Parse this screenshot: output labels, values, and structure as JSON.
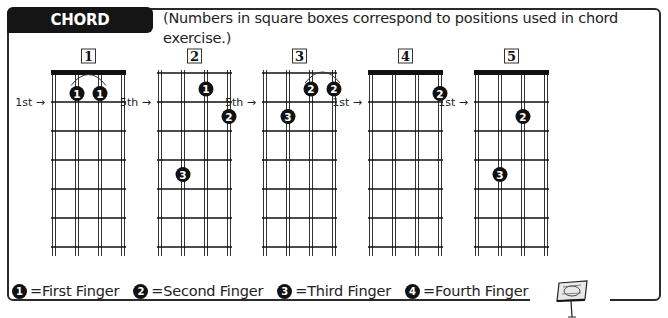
{
  "header": {
    "title": "CHORD POSITIONS",
    "subtitle": "(Numbers in square boxes correspond to positions used in chord exercise.)"
  },
  "diagrams": [
    {
      "label": "1",
      "nut": true,
      "fret_label": "1st",
      "fingers": [
        {
          "finger": "1",
          "string": 2,
          "fret": 1
        },
        {
          "finger": "1",
          "string": 3,
          "fret": 1
        }
      ],
      "barre": [
        2,
        3
      ]
    },
    {
      "label": "2",
      "nut": false,
      "fret_label": "5th",
      "fingers": [
        {
          "finger": "1",
          "string": 3,
          "fret": 0
        },
        {
          "finger": "2",
          "string": 4,
          "fret": 2
        },
        {
          "finger": "3",
          "string": 2,
          "fret": 4
        }
      ]
    },
    {
      "label": "3",
      "nut": false,
      "fret_label": "5th",
      "fingers": [
        {
          "finger": "2",
          "string": 3,
          "fret": 0
        },
        {
          "finger": "2",
          "string": 4,
          "fret": 0
        },
        {
          "finger": "3",
          "string": 2,
          "fret": 2
        }
      ],
      "barre": [
        3,
        4
      ]
    },
    {
      "label": "4",
      "nut": true,
      "fret_label": "1st",
      "fingers": [
        {
          "finger": "2",
          "string": 4,
          "fret": 1
        }
      ]
    },
    {
      "label": "5",
      "nut": true,
      "fret_label": "1st",
      "fingers": [
        {
          "finger": "2",
          "string": 3,
          "fret": 2
        },
        {
          "finger": "3",
          "string": 2,
          "fret": 4
        }
      ]
    }
  ],
  "legend": [
    {
      "symbol": "1",
      "label": "=First Finger"
    },
    {
      "symbol": "2",
      "label": "=Second Finger"
    },
    {
      "symbol": "3",
      "label": "=Third Finger"
    },
    {
      "symbol": "4",
      "label": "=Fourth Finger"
    }
  ],
  "decor": {
    "icon": "music-stand-icon"
  }
}
